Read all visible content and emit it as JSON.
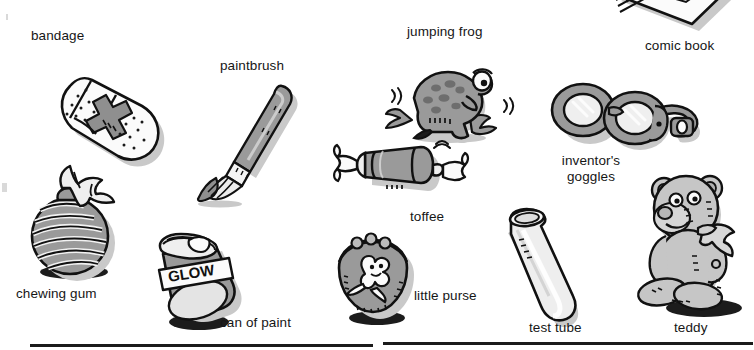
{
  "page": {
    "background_color": "#ffffff",
    "text_color": "#161616",
    "line_color": "#1b1b1b",
    "fill_gray": "#9a9a9a",
    "fill_light": "#e8e8e8",
    "shadow_gray": "#c9c9c9"
  },
  "items": [
    {
      "label": "bandage",
      "name": "bandage"
    },
    {
      "label": "paintbrush",
      "name": "paintbrush"
    },
    {
      "label": "jumping frog",
      "name": "jumping-frog"
    },
    {
      "label": "comic book",
      "name": "comic-book"
    },
    {
      "label": "inventor's\ngoggles",
      "name": "inventors-goggles",
      "line1": "inventor's",
      "line2": "goggles"
    },
    {
      "label": "toffee",
      "name": "toffee"
    },
    {
      "label": "chewing gum",
      "name": "chewing-gum"
    },
    {
      "label": "can of paint",
      "name": "can-of-paint"
    },
    {
      "label": "little purse",
      "name": "little-purse"
    },
    {
      "label": "test tube",
      "name": "test-tube"
    },
    {
      "label": "teddy",
      "name": "teddy"
    }
  ],
  "labels": {
    "bandage": "bandage",
    "paintbrush": "paintbrush",
    "jumping_frog": "jumping frog",
    "comic_book": "comic book",
    "goggles_line1": "inventor's",
    "goggles_line2": "goggles",
    "toffee": "toffee",
    "chewing_gum": "chewing gum",
    "can_of_paint": "can of paint",
    "little_purse": "little purse",
    "test_tube": "test tube",
    "teddy": "teddy"
  },
  "artwork_text": {
    "paint_can_label": "GLOW"
  },
  "footer": {
    "left_box_rule": "",
    "right_box_rule": ""
  }
}
